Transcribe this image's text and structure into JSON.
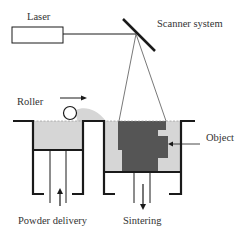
{
  "diagram": {
    "labels": {
      "laser": "Laser",
      "scanner": "Scanner system",
      "roller": "Roller",
      "object": "Object",
      "powder_delivery": "Powder delivery",
      "sintering": "Sintering"
    },
    "colors": {
      "line": "#1a1a1a",
      "powder": "#d6d6d6",
      "object": "#555555",
      "text": "#333333",
      "background": "#ffffff"
    },
    "nodes": [
      {
        "id": "laser",
        "label": "Laser",
        "shape": "rectangle"
      },
      {
        "id": "scanner",
        "label": "Scanner system",
        "shape": "mirror"
      },
      {
        "id": "roller",
        "label": "Roller",
        "shape": "circle"
      },
      {
        "id": "powder-chamber",
        "label": "Powder delivery",
        "shape": "chamber"
      },
      {
        "id": "build-chamber",
        "label": "Sintering",
        "shape": "chamber"
      },
      {
        "id": "object",
        "label": "Object",
        "shape": "stepped-block"
      }
    ],
    "edges": [
      {
        "from": "laser",
        "to": "scanner",
        "type": "beam"
      },
      {
        "from": "scanner",
        "to": "build-chamber",
        "type": "beam-cone"
      },
      {
        "from": "roller",
        "to": "build-chamber",
        "type": "motion-arrow"
      },
      {
        "from": "object",
        "to": "build-chamber",
        "type": "label-pointer"
      }
    ]
  }
}
